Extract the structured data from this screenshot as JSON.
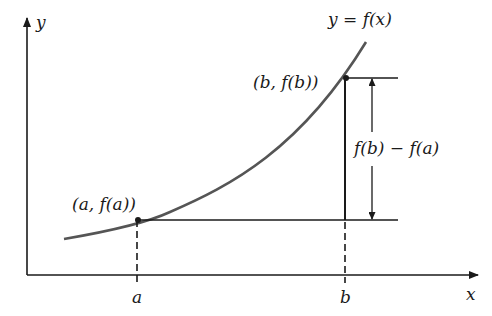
{
  "diagram": {
    "axes": {
      "x_label": "x",
      "y_label": "y"
    },
    "curve_label": "y = f(x)",
    "points": [
      {
        "id": "a",
        "label": "(a, f(a))",
        "tick_label": "a"
      },
      {
        "id": "b",
        "label": "(b, f(b))",
        "tick_label": "b"
      }
    ],
    "difference_label": "f(b) − f(a)",
    "colors": {
      "curve": "#555555",
      "lines": "#1a1a1a",
      "background": "#ffffff"
    }
  }
}
